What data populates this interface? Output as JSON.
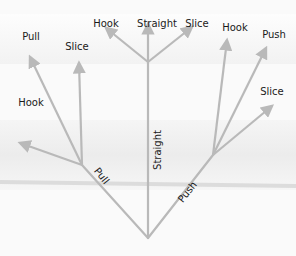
{
  "diagram": {
    "type": "tree",
    "root": {
      "x": 148,
      "y": 238
    },
    "colors": {
      "arrow": "#b9b9b9",
      "text": "#1a1a1a",
      "background": "#f7f7f7"
    },
    "trunks": [
      {
        "id": "pull",
        "label": "Pull",
        "from": [
          148,
          238
        ],
        "to": [
          82,
          165
        ],
        "label_pos": [
          99,
          178
        ],
        "label_rot": 52
      },
      {
        "id": "straight",
        "label": "Straight",
        "from": [
          148,
          238
        ],
        "to": [
          148,
          62
        ],
        "label_pos": [
          161,
          150
        ],
        "label_rot": -90
      },
      {
        "id": "push",
        "label": "Push",
        "from": [
          148,
          238
        ],
        "to": [
          213,
          155
        ],
        "label_pos": [
          190,
          194
        ],
        "label_rot": -52
      }
    ],
    "branches": [
      {
        "group": "pull",
        "label": "Hook",
        "from": [
          82,
          165
        ],
        "to": [
          20,
          143
        ],
        "label_pos": [
          31,
          106
        ]
      },
      {
        "group": "pull",
        "label": "Pull",
        "from": [
          82,
          165
        ],
        "to": [
          30,
          57
        ],
        "label_pos": [
          31,
          40
        ]
      },
      {
        "group": "pull",
        "label": "Slice",
        "from": [
          82,
          165
        ],
        "to": [
          79,
          63
        ],
        "label_pos": [
          77,
          50
        ]
      },
      {
        "group": "straight",
        "label": "Hook",
        "from": [
          148,
          62
        ],
        "to": [
          106,
          28
        ],
        "label_pos": [
          106,
          27
        ]
      },
      {
        "group": "straight",
        "label": "Straight",
        "from": [
          148,
          62
        ],
        "to": [
          148,
          24
        ],
        "label_pos": [
          157,
          27
        ]
      },
      {
        "group": "straight",
        "label": "Slice",
        "from": [
          148,
          62
        ],
        "to": [
          192,
          27
        ],
        "label_pos": [
          197,
          27
        ]
      },
      {
        "group": "push",
        "label": "Hook",
        "from": [
          213,
          155
        ],
        "to": [
          227,
          40
        ],
        "label_pos": [
          235,
          31
        ]
      },
      {
        "group": "push",
        "label": "Push",
        "from": [
          213,
          155
        ],
        "to": [
          266,
          48
        ],
        "label_pos": [
          274,
          38
        ]
      },
      {
        "group": "push",
        "label": "Slice",
        "from": [
          213,
          155
        ],
        "to": [
          272,
          106
        ],
        "label_pos": [
          272,
          95
        ]
      }
    ]
  }
}
